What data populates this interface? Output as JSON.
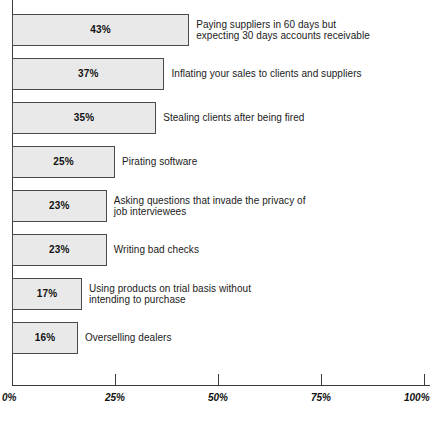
{
  "chart_data": {
    "type": "bar",
    "orientation": "horizontal",
    "title": "",
    "xlabel": "",
    "ylabel": "",
    "xlim": [
      0,
      100
    ],
    "grid": false,
    "legend": false,
    "value_suffix": "%",
    "categories": [
      "Paying suppliers in 60 days but\nexpecting 30 days accounts receivable",
      "Inflating your sales to clients and suppliers",
      "Stealing clients after being fired",
      "Pirating software",
      "Asking questions that invade the privacy of\njob interviewees",
      "Writing bad checks",
      "Using products on trial basis without\nintending to purchase",
      "Overselling dealers"
    ],
    "values": [
      43,
      37,
      35,
      25,
      23,
      23,
      17,
      16
    ],
    "value_labels": [
      "43%",
      "37%",
      "35%",
      "25%",
      "23%",
      "23%",
      "17%",
      "16%"
    ],
    "ticks": [
      0,
      25,
      50,
      75,
      100
    ],
    "tick_labels": [
      "0%",
      "25%",
      "50%",
      "75%",
      "100%"
    ],
    "colors": {
      "bar_fill": "#e9e9e9",
      "bar_border": "#4a4a4a",
      "axis": "#3a3a3a",
      "text": "#1a1a1a",
      "background": "#ffffff"
    }
  }
}
